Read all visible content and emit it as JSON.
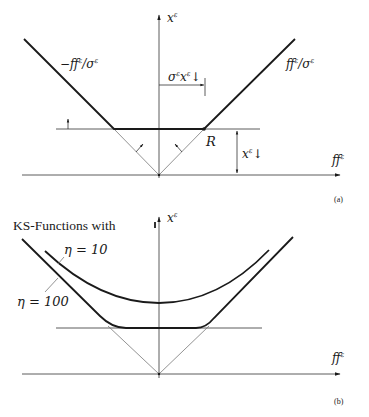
{
  "panel_a": {
    "y_axis_label": "x",
    "y_axis_sup": "ε",
    "x_axis_label": "ff",
    "x_axis_sup": "ε",
    "left_line_label": "−ff",
    "left_line_sup": "ε",
    "left_line_denom": "/σ",
    "left_line_denom_sup": "ε",
    "right_line_label": "ff",
    "right_line_sup": "ε",
    "right_line_denom": "/σ",
    "right_line_denom_sup": "ε",
    "width_dim_label": "σ",
    "width_dim_sup": "ε",
    "width_dim_x": "x",
    "width_dim_x_sup": "ε",
    "width_dim_arrow": "↓",
    "height_dim_label": "x",
    "height_dim_sup": "ε",
    "height_dim_arrow": "↓",
    "point_label": "R",
    "caption": "(a)"
  },
  "panel_b": {
    "title": "KS-Functions with",
    "y_axis_label": "x",
    "y_axis_sup": "ε",
    "x_axis_label": "ff",
    "x_axis_sup": "ε",
    "curve_1_label": "η = 10",
    "curve_2_label": "η = 100",
    "caption": "(b)"
  }
}
